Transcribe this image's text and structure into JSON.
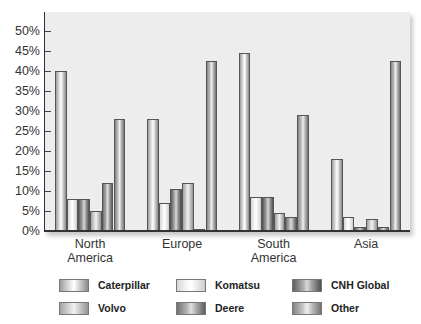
{
  "chart_data": {
    "type": "bar",
    "title": "",
    "xlabel": "",
    "ylabel": "",
    "ylim": [
      0,
      50
    ],
    "yticks": [
      "0%",
      "5%",
      "10%",
      "15%",
      "20%",
      "25%",
      "30%",
      "35%",
      "40%",
      "45%",
      "50%"
    ],
    "categories": [
      "North America",
      "Europe",
      "South America",
      "Asia"
    ],
    "category_labels": [
      [
        "North",
        "America"
      ],
      [
        "Europe",
        ""
      ],
      [
        "South",
        "America"
      ],
      [
        "Asia",
        ""
      ]
    ],
    "series": [
      {
        "name": "Caterpillar",
        "values": [
          40,
          28,
          44.5,
          18
        ]
      },
      {
        "name": "Komatsu",
        "values": [
          8,
          7,
          8.5,
          3.5
        ]
      },
      {
        "name": "CNH Global",
        "values": [
          8,
          10.5,
          8.5,
          1
        ]
      },
      {
        "name": "Volvo",
        "values": [
          5,
          12,
          4.5,
          3
        ]
      },
      {
        "name": "Deere",
        "values": [
          12,
          0.3,
          3.5,
          1
        ]
      },
      {
        "name": "Other",
        "values": [
          28,
          42.5,
          29,
          42.5
        ]
      }
    ],
    "legend": [
      "Caterpillar",
      "Komatsu",
      "CNH Global",
      "Volvo",
      "Deere",
      "Other"
    ],
    "legend_position": "bottom",
    "grid": false
  },
  "legend": {
    "caterpillar": "Caterpillar",
    "komatsu": "Komatsu",
    "cnh": "CNH Global",
    "volvo": "Volvo",
    "deere": "Deere",
    "other": "Other"
  }
}
